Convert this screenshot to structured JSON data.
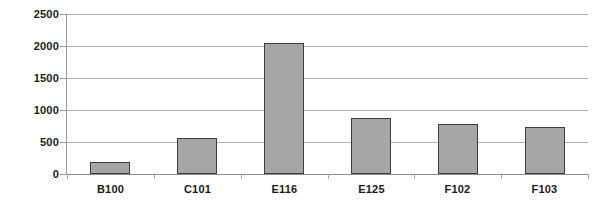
{
  "chart_data": {
    "type": "bar",
    "title": "",
    "subtitle": "",
    "xlabel": "",
    "ylabel": "",
    "categories": [
      "B100",
      "C101",
      "E116",
      "E125",
      "F102",
      "F103"
    ],
    "values": [
      180,
      560,
      2040,
      880,
      780,
      730
    ],
    "series": [
      {
        "name": "",
        "values": [
          180,
          560,
          2040,
          880,
          780,
          730
        ]
      }
    ],
    "ylim": [
      0,
      2500
    ],
    "yticks": [
      0,
      500,
      1000,
      1500,
      2000,
      2500
    ],
    "ytick_labels": [
      "0",
      "500",
      "1000",
      "1500",
      "2000",
      "2500"
    ],
    "grid": true,
    "grid_axis": "y",
    "legend": false,
    "legend_position": "none",
    "annotations": [],
    "colors": {
      "bar_fill": "#a6a6a6",
      "bar_border": "#3d3d3d",
      "gridline": "#b3b3b3",
      "axis": "#9a9a9a",
      "text": "#1a1a1a",
      "background": "#ffffff"
    }
  }
}
